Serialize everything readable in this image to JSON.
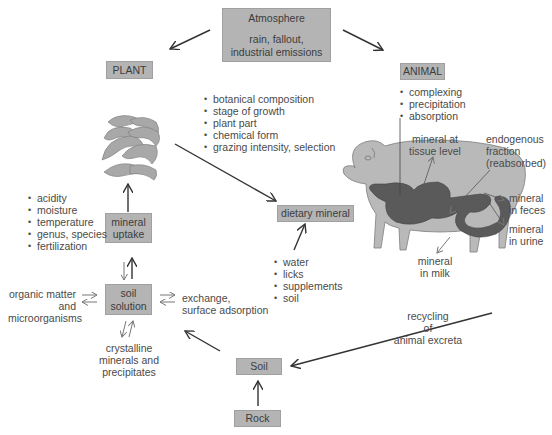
{
  "diagram": {
    "atmosphere": {
      "title": "Atmosphere",
      "line1": "rain, fallout,",
      "line2": "industrial emissions"
    },
    "plant": {
      "label": "PLANT"
    },
    "animal": {
      "label": "ANIMAL"
    },
    "plant_factors": [
      "botanical composition",
      "stage of growth",
      "plant part",
      "chemical form",
      "grazing intensity, selection"
    ],
    "animal_factors": [
      "complexing",
      "precipitation",
      "absorption"
    ],
    "soil_factors": [
      "acidity",
      "moisture",
      "temperature",
      "genus, species",
      "fertilization"
    ],
    "mineral_uptake": {
      "line1": "mineral",
      "line2": "uptake"
    },
    "dietary_mineral": {
      "label": "dietary mineral"
    },
    "dietary_sources": [
      "water",
      "licks",
      "supplements",
      "soil"
    ],
    "soil_solution": {
      "line1": "soil",
      "line2": "solution"
    },
    "organic_matter": {
      "line1": "organic matter",
      "line2": "and",
      "line3": "microorganisms"
    },
    "exchange": {
      "line1": "exchange,",
      "line2": "surface adsorption"
    },
    "crystalline": {
      "line1": "crystalline",
      "line2": "minerals and",
      "line3": "precipitates"
    },
    "soil": {
      "label": "Soil"
    },
    "rock": {
      "label": "Rock"
    },
    "recycling": {
      "line1": "recycling",
      "line2": "of",
      "line3": "animal excreta"
    },
    "tissue": {
      "line1": "mineral at",
      "line2": "tissue level"
    },
    "endogenous": {
      "line1": "endogenous",
      "line2": "fraction",
      "line3": "(reabsorbed)"
    },
    "feces": {
      "line1": "mineral",
      "line2": "in feces"
    },
    "urine": {
      "line1": "mineral",
      "line2": "in urine"
    },
    "milk": {
      "line1": "mineral",
      "line2": "in milk"
    },
    "colors": {
      "box_fill": "#b4b4b4",
      "sheep_body": "#b9b9b9",
      "sheep_gut": "#5a5a5a",
      "plant": "#a8a8a8",
      "arrow": "#333333"
    }
  }
}
